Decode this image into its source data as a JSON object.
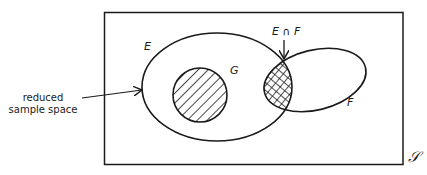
{
  "diagram": {
    "type": "venn",
    "sample_space_symbol": "𝒮",
    "sets": [
      {
        "id": "E",
        "label": "E"
      },
      {
        "id": "F",
        "label": "F"
      },
      {
        "id": "G",
        "label": "G"
      }
    ],
    "intersection_label": "E ∩ F",
    "annotation": {
      "line1": "reduced",
      "line2": "sample space"
    },
    "colors": {
      "stroke": "#1a1a1a",
      "background": "#ffffff"
    }
  }
}
